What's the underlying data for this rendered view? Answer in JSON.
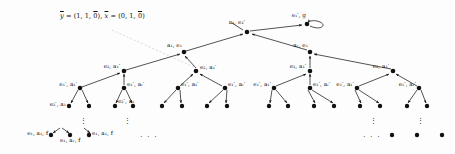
{
  "figure": {
    "type": "tree-diagram",
    "background": "#fdfdfd",
    "node_color": "#111111",
    "edge_color": "#1a1a1a",
    "faint_edge_color": "#cfcfcf"
  },
  "annotation": {
    "vector_text": "ȳ = (1, 1, 0̄), x̄ = (0, 1, 0̄)",
    "y_label": "ȳ",
    "y_value": "(1, 1, 0̄)",
    "x_label": "x̄",
    "x_value": "(0, 1, 0̄)"
  },
  "labels": {
    "root": "a₁, e₂′",
    "self_loop_node": "e₁′, g",
    "level2_left": "a₁, e₁",
    "level2_right": "aᵣ, e₁",
    "level3": "e₂, a₁′",
    "level4_a": "e₁′, a₁′",
    "level4_r": "e₁′, aᵣ′",
    "level5": "e₂′, a₁",
    "level6_a": "e₁, a₁, f",
    "level6_r": "e₁, aᵣ, f",
    "ellipsis_h": "· · ·",
    "ellipsis_v": "⋮"
  },
  "nodes": [
    {
      "id": "root",
      "name": "root-node",
      "x": 247,
      "y": 32,
      "label": "a₁, e₂′",
      "label_dx": -2,
      "label_dy": -9,
      "label_anchor": "end"
    },
    {
      "id": "loop",
      "name": "self-loop-node",
      "x": 307,
      "y": 24,
      "label": "e₁′, g",
      "label_dx": -1,
      "label_dy": -8,
      "label_anchor": "end"
    },
    {
      "id": "l2a",
      "name": "level2-left-node",
      "x": 184,
      "y": 52,
      "label": "a₁, e₁",
      "label_dx": -2,
      "label_dy": -6,
      "label_anchor": "end"
    },
    {
      "id": "l2b",
      "name": "level2-right-node",
      "x": 310,
      "y": 52,
      "label": "aᵣ, e₁",
      "label_dx": -2,
      "label_dy": -6,
      "label_anchor": "end"
    },
    {
      "id": "l3a",
      "name": "level3-node-1",
      "x": 124,
      "y": 71,
      "label": "e₂, a₁′",
      "label_dx": -4,
      "label_dy": -4,
      "label_anchor": "end"
    },
    {
      "id": "l3b",
      "name": "level3-node-2",
      "x": 196,
      "y": 71,
      "label": "e₂, a₁′",
      "label_dx": 4,
      "label_dy": -3,
      "label_anchor": "start"
    },
    {
      "id": "l3c",
      "name": "level3-node-3",
      "x": 310,
      "y": 71,
      "label": "e₂, a₁′",
      "label_dx": -4,
      "label_dy": -4,
      "label_anchor": "end"
    },
    {
      "id": "l3d",
      "name": "level3-node-4",
      "x": 393,
      "y": 71,
      "label": "e₂, a₁′",
      "label_dx": -4,
      "label_dy": -4,
      "label_anchor": "end"
    },
    {
      "id": "l4a",
      "name": "level4-node-1",
      "x": 80,
      "y": 88,
      "label": "e₁′, a₁′",
      "label_dx": -3,
      "label_dy": -3,
      "label_anchor": "end"
    },
    {
      "id": "l4b",
      "name": "level4-node-2",
      "x": 124,
      "y": 88,
      "label": "e₁′, aᵣ′",
      "label_dx": 3,
      "label_dy": -3,
      "label_anchor": "start"
    },
    {
      "id": "l4c",
      "name": "level4-node-3",
      "x": 178,
      "y": 88,
      "label": "e₁′, a₁′",
      "label_dx": 3,
      "label_dy": -3,
      "label_anchor": "start"
    },
    {
      "id": "l4d",
      "name": "level4-node-4",
      "x": 225,
      "y": 88,
      "label": "e₁′, aᵣ′",
      "label_dx": 3,
      "label_dy": -3,
      "label_anchor": "start"
    },
    {
      "id": "l4e",
      "name": "level4-node-5",
      "x": 274,
      "y": 88,
      "label": "e₁′, a₁′",
      "label_dx": -3,
      "label_dy": -3,
      "label_anchor": "end"
    },
    {
      "id": "l4f",
      "name": "level4-node-6",
      "x": 310,
      "y": 88,
      "label": "e₁′, aᵣ′",
      "label_dx": 3,
      "label_dy": -3,
      "label_anchor": "start"
    },
    {
      "id": "l4g",
      "name": "level4-node-7",
      "x": 357,
      "y": 88,
      "label": "e₁′, a₁′",
      "label_dx": -3,
      "label_dy": -3,
      "label_anchor": "end"
    },
    {
      "id": "l4h",
      "name": "level4-node-8",
      "x": 419,
      "y": 88,
      "label": "e₁′, aᵣ′",
      "label_dx": -3,
      "label_dy": -3,
      "label_anchor": "end"
    }
  ],
  "leaves": [
    {
      "name": "leaf-1",
      "x": 69,
      "y": 106,
      "label": "e₂′, a₁",
      "anchor": "end",
      "dx": -3,
      "dy": 2
    },
    {
      "name": "leaf-2",
      "x": 89,
      "y": 106,
      "label": "",
      "anchor": "start",
      "dx": 0,
      "dy": 0
    },
    {
      "name": "leaf-3",
      "x": 115,
      "y": 106,
      "label": "e₂′, a₁",
      "anchor": "start",
      "dx": 3,
      "dy": -1
    },
    {
      "name": "leaf-4",
      "x": 133,
      "y": 106,
      "label": "",
      "anchor": "start",
      "dx": 0,
      "dy": 0
    },
    {
      "name": "leaf-5",
      "x": 162,
      "y": 106,
      "label": "",
      "anchor": "start",
      "dx": 0,
      "dy": 0
    },
    {
      "name": "leaf-6",
      "x": 182,
      "y": 106,
      "label": "",
      "anchor": "start",
      "dx": 0,
      "dy": 0
    },
    {
      "name": "leaf-7",
      "x": 207,
      "y": 106,
      "label": "",
      "anchor": "start",
      "dx": 0,
      "dy": 0
    },
    {
      "name": "leaf-8",
      "x": 227,
      "y": 106,
      "label": "",
      "anchor": "start",
      "dx": 0,
      "dy": 0
    },
    {
      "name": "leaf-9",
      "x": 269,
      "y": 106,
      "label": "",
      "anchor": "start",
      "dx": 0,
      "dy": 0
    },
    {
      "name": "leaf-10",
      "x": 288,
      "y": 106,
      "label": "",
      "anchor": "start",
      "dx": 0,
      "dy": 0
    },
    {
      "name": "leaf-11",
      "x": 314,
      "y": 106,
      "label": "",
      "anchor": "start",
      "dx": 0,
      "dy": 0
    },
    {
      "name": "leaf-12",
      "x": 334,
      "y": 106,
      "label": "",
      "anchor": "start",
      "dx": 0,
      "dy": 0
    },
    {
      "name": "leaf-13",
      "x": 360,
      "y": 106,
      "label": "",
      "anchor": "start",
      "dx": 0,
      "dy": 0
    },
    {
      "name": "leaf-14",
      "x": 380,
      "y": 106,
      "label": "",
      "anchor": "start",
      "dx": 0,
      "dy": 0
    },
    {
      "name": "leaf-15",
      "x": 407,
      "y": 106,
      "label": "",
      "anchor": "start",
      "dx": 0,
      "dy": 0
    },
    {
      "name": "leaf-16",
      "x": 427,
      "y": 106,
      "label": "",
      "anchor": "start",
      "dx": 0,
      "dy": 0
    }
  ],
  "deep_leaves": [
    {
      "name": "deep-leaf-1",
      "x": 51,
      "y": 135,
      "label": "e₁, a₁, f",
      "anchor": "end",
      "dx": -3,
      "dy": 2
    },
    {
      "name": "deep-leaf-2",
      "x": 70,
      "y": 135,
      "label": "e₁, aᵣ, f",
      "anchor": "start",
      "dx": -10,
      "dy": 9
    },
    {
      "name": "deep-leaf-3",
      "x": 89,
      "y": 135,
      "label": "e₁, a₁, f",
      "anchor": "start",
      "dx": 3,
      "dy": 2
    },
    {
      "name": "deep-leaf-4",
      "x": 392,
      "y": 135,
      "label": "",
      "anchor": "start",
      "dx": 0,
      "dy": 0
    },
    {
      "name": "deep-leaf-5",
      "x": 417,
      "y": 135,
      "label": "",
      "anchor": "start",
      "dx": 0,
      "dy": 0
    },
    {
      "name": "deep-leaf-6",
      "x": 442,
      "y": 135,
      "label": "",
      "anchor": "start",
      "dx": 0,
      "dy": 0
    }
  ],
  "ellipses": [
    {
      "name": "ellipsis-bottom-left",
      "x": 140,
      "y": 133,
      "text": "· · ·",
      "kind": "horizontal"
    },
    {
      "name": "ellipsis-bottom-right",
      "x": 363,
      "y": 133,
      "text": "· · ·",
      "kind": "horizontal"
    },
    {
      "name": "ellipsis-vert-1",
      "x": 80,
      "y": 118,
      "text": "⋮",
      "kind": "vertical"
    },
    {
      "name": "ellipsis-vert-2",
      "x": 124,
      "y": 118,
      "text": "⋮",
      "kind": "vertical"
    },
    {
      "name": "ellipsis-vert-3",
      "x": 370,
      "y": 118,
      "text": "⋮",
      "kind": "vertical"
    },
    {
      "name": "ellipsis-vert-4",
      "x": 417,
      "y": 118,
      "text": "⋮",
      "kind": "vertical"
    }
  ]
}
